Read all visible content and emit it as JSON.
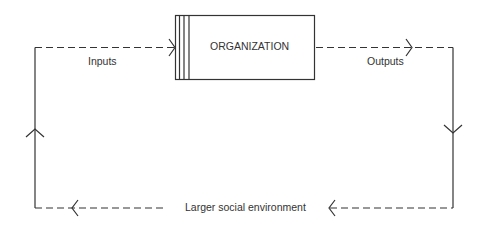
{
  "diagram": {
    "organization": "ORGANIZATION",
    "inputs": "Inputs",
    "outputs": "Outputs",
    "environment": "Larger social environment"
  },
  "colors": {
    "line": "#333333",
    "text": "#333333",
    "background": "#ffffff"
  }
}
